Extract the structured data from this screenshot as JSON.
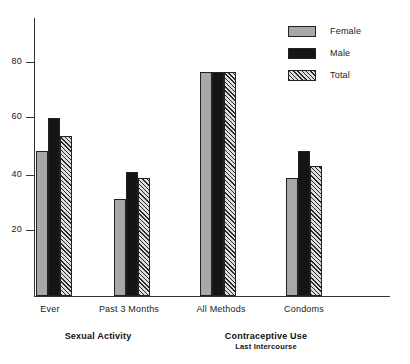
{
  "chart_data": {
    "type": "bar",
    "title": "",
    "xlabel": "",
    "ylabel": "",
    "ylim": [
      0,
      92
    ],
    "grid": false,
    "legend_position": "top-right",
    "categories": [
      "Ever",
      "Past 3 Months",
      "All Methods",
      "Condoms"
    ],
    "panels": [
      {
        "title": "Sexual Activity",
        "subtitle": "",
        "categories": [
          "Ever",
          "Past 3 Months"
        ]
      },
      {
        "title": "Contraceptive Use",
        "subtitle": "Last Intercourse",
        "categories": [
          "All Methods",
          "Condoms"
        ]
      }
    ],
    "series": [
      {
        "name": "Female",
        "color": "#a8a8a8",
        "pattern": "solid",
        "values": [
          48,
          32,
          74,
          39
        ]
      },
      {
        "name": "Male",
        "color": "#151515",
        "pattern": "solid",
        "values": [
          59,
          41,
          74,
          48
        ]
      },
      {
        "name": "Total",
        "color": "#cfcfcf",
        "pattern": "diagonal-hatch",
        "values": [
          53,
          39,
          74,
          43
        ]
      }
    ],
    "yticks": [
      20,
      40,
      60,
      80
    ],
    "ytick_labels": [
      "20",
      "40",
      "60",
      "80"
    ]
  },
  "legend": {
    "items": [
      {
        "label": "Female",
        "series": "female"
      },
      {
        "label": "Male",
        "series": "male"
      },
      {
        "label": "Total",
        "series": "total"
      }
    ]
  },
  "axis": {
    "y_labels": [
      "80",
      "60",
      "40",
      "20"
    ]
  }
}
